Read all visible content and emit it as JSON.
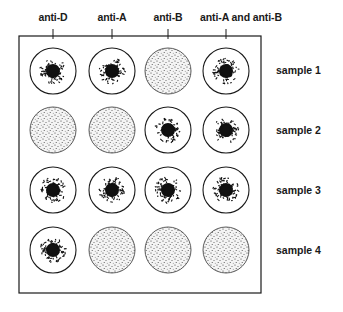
{
  "diagram": {
    "columns": [
      {
        "label": "anti-D",
        "x": 53
      },
      {
        "label": "anti-A",
        "x": 112
      },
      {
        "label": "anti-B",
        "x": 168
      },
      {
        "label": "anti-A and anti-B",
        "x": 226
      }
    ],
    "rows": [
      {
        "label": "sample 1",
        "y": 71,
        "results": [
          "agglutinated",
          "agglutinated",
          "no-agglutination",
          "agglutinated"
        ]
      },
      {
        "label": "sample 2",
        "y": 130,
        "results": [
          "no-agglutination",
          "no-agglutination",
          "agglutinated",
          "agglutinated"
        ]
      },
      {
        "label": "sample 3",
        "y": 190,
        "results": [
          "agglutinated",
          "agglutinated",
          "agglutinated",
          "agglutinated"
        ]
      },
      {
        "label": "sample 4",
        "y": 250,
        "results": [
          "agglutinated",
          "no-agglutination",
          "no-agglutination",
          "no-agglutination"
        ]
      }
    ],
    "colors": {
      "ink": "#1a1a1a",
      "background": "#ffffff"
    }
  }
}
